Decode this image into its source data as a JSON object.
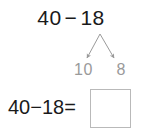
{
  "problem": {
    "top_expression": {
      "minuend": "40",
      "operator": "−",
      "subtrahend": "18"
    },
    "decomposition": {
      "description": "subtrahend-split-arrows",
      "left_part": "10",
      "right_part": "8"
    },
    "equation": {
      "text": "40−18=",
      "answer_value": ""
    }
  },
  "colors": {
    "ink": "#1a1a1a",
    "hint": "#9a9a9a",
    "box_border": "#b9b9b9",
    "background": "#ffffff"
  }
}
